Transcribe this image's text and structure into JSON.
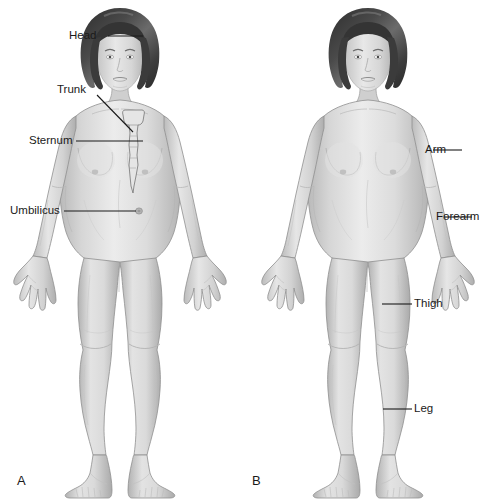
{
  "figure": {
    "panels": [
      {
        "letter": "A",
        "description": "Axial body regions",
        "labels": [
          {
            "name": "head-label",
            "text": "Head"
          },
          {
            "name": "trunk-label",
            "text": "Trunk"
          },
          {
            "name": "sternum-label",
            "text": "Sternum"
          },
          {
            "name": "umbilicus-label",
            "text": "Umbilicus"
          }
        ]
      },
      {
        "letter": "B",
        "description": "Appendicular body regions",
        "labels": [
          {
            "name": "arm-label",
            "text": "Arm"
          },
          {
            "name": "forearm-label",
            "text": "Forearm"
          },
          {
            "name": "thigh-label",
            "text": "Thigh"
          },
          {
            "name": "leg-label",
            "text": "Leg"
          }
        ]
      }
    ]
  },
  "colors": {
    "background": "#ffffff",
    "text": "#1a1a1a",
    "leader_line": "#1a1a1a",
    "skin_light": "#eeeeee",
    "skin_mid": "#d8d8d8",
    "skin_shadow": "#bdbdbd",
    "skin_deep_shadow": "#a6a6a6",
    "outline": "#8a8a8a",
    "hair_dark": "#3a3a3a",
    "hair_mid": "#5a5a5a",
    "hair_highlight": "#7a7a7a"
  }
}
